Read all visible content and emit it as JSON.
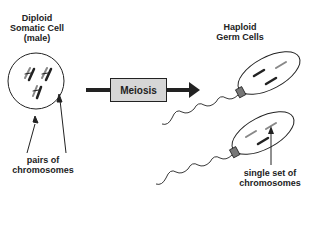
{
  "diagram": {
    "left_title": {
      "line1": "Diploid",
      "line2": "Somatic Cell",
      "line3": "(male)"
    },
    "right_title": {
      "line1": "Haploid",
      "line2": "Germ Cells"
    },
    "process_label": "Meiosis",
    "left_caption": {
      "line1": "pairs of",
      "line2": "chromosomes"
    },
    "right_caption": {
      "line1": "single set of",
      "line2": "chromosomes"
    },
    "colors": {
      "ink": "#222222",
      "process_box_fill": "#d6d6d6",
      "chromosome_light": "#888888",
      "sperm_midpiece": "#777777"
    }
  }
}
